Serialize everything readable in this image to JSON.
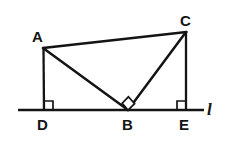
{
  "figure": {
    "stroke_color": "#141414",
    "background_color": "#ffffff",
    "stroke_width": 2.2,
    "labels": {
      "A": "A",
      "B": "B",
      "C": "C",
      "D": "D",
      "E": "E",
      "line": "l"
    },
    "points": {
      "A": {
        "x": 43,
        "y": 48
      },
      "B": {
        "x": 128,
        "y": 110
      },
      "C": {
        "x": 186,
        "y": 32
      },
      "D": {
        "x": 44,
        "y": 110
      },
      "E": {
        "x": 186,
        "y": 110
      }
    },
    "line_l": {
      "x1": 18,
      "y1": 110,
      "x2": 204,
      "y2": 110
    },
    "segments": [
      {
        "name": "AC",
        "from": "A",
        "to": "C"
      },
      {
        "name": "AB",
        "from": "A",
        "to": "B"
      },
      {
        "name": "BC",
        "from": "B",
        "to": "C"
      },
      {
        "name": "AD",
        "from": "A",
        "to": "D"
      },
      {
        "name": "CE",
        "from": "C",
        "to": "E"
      }
    ],
    "right_angles": [
      {
        "at": "D",
        "type": "square",
        "orientation": "up-right"
      },
      {
        "at": "B",
        "type": "square",
        "orientation": "rotated"
      },
      {
        "at": "E",
        "type": "square",
        "orientation": "up-left"
      }
    ]
  }
}
